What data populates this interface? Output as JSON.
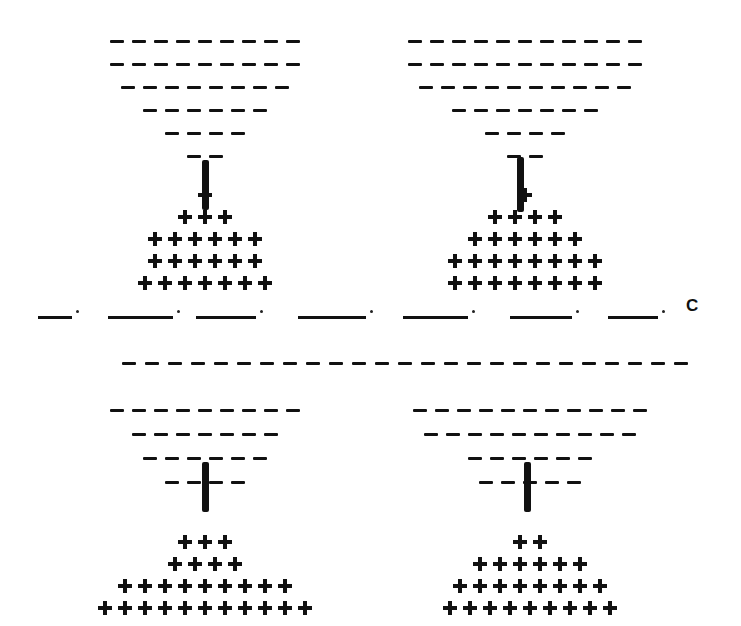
{
  "figure": {
    "label": "C",
    "divider_segments": 7,
    "panels": [
      {
        "id": "top-left",
        "dash_rows": [
          9,
          9,
          8,
          6,
          4,
          2
        ],
        "plus_rows": [
          1,
          3,
          6,
          6,
          7
        ],
        "stem": true
      },
      {
        "id": "top-right",
        "dash_rows": [
          11,
          11,
          10,
          7,
          4,
          2
        ],
        "plus_rows": [
          1,
          4,
          6,
          8,
          8
        ],
        "stem": true
      },
      {
        "id": "bottom-left",
        "dash_rows": [
          9,
          7,
          6,
          4
        ],
        "plus_rows": [
          3,
          4,
          9,
          11
        ],
        "stem": true
      },
      {
        "id": "bottom-right",
        "dash_rows": [
          11,
          10,
          6,
          5
        ],
        "plus_rows": [
          2,
          6,
          8,
          9
        ],
        "stem": true
      }
    ],
    "shared_top_row_dashes": 25
  }
}
